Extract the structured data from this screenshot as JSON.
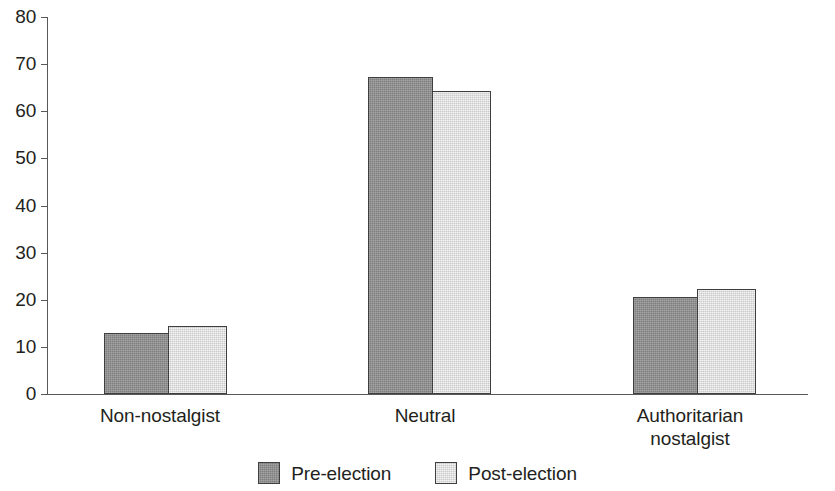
{
  "chart_data": {
    "type": "bar",
    "title": "",
    "subtitle": "",
    "xlabel": "",
    "ylabel": "",
    "categories": [
      "Non-nostalgist",
      "Neutral",
      "Authoritarian nostalgist"
    ],
    "category_lines": [
      [
        "Non-nostalgist"
      ],
      [
        "Neutral"
      ],
      [
        "Authoritarian",
        "nostalgist"
      ]
    ],
    "series": [
      {
        "name": "Pre-election",
        "color": "#8f8f8f",
        "values": [
          13.0,
          67.2,
          20.6
        ]
      },
      {
        "name": "Post-election",
        "color": "#e2e2e2",
        "values": [
          14.5,
          64.2,
          22.3
        ]
      }
    ],
    "ylim": [
      0,
      80
    ],
    "yticks": [
      0,
      10,
      20,
      30,
      40,
      50,
      60,
      70,
      80
    ],
    "ytick_labels": [
      "0",
      "10",
      "20",
      "30",
      "40",
      "50",
      "60",
      "70",
      "80"
    ],
    "grid": false,
    "legend_position": "bottom",
    "bar_border_color": "#3f3f3f",
    "axis_color": "#595959",
    "text_color": "#231f20",
    "background": "#ffffff"
  },
  "legend": {
    "items": [
      {
        "label": "Pre-election",
        "swatch": "pre"
      },
      {
        "label": "Post-election",
        "swatch": "post"
      }
    ]
  }
}
